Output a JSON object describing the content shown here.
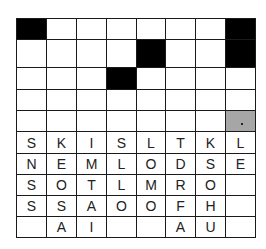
{
  "puzzle": {
    "type": "crossword-letter-drop",
    "columns": 8,
    "col_edges": [
      16,
      46,
      76,
      106,
      136,
      165,
      195,
      225,
      255
    ],
    "row_edges": [
      18,
      39,
      67,
      89,
      110,
      131,
      153,
      174,
      195,
      216,
      237
    ],
    "colors": {
      "black": "#000000",
      "gray": "#a6a6a6",
      "line": "#1a1a1a",
      "text": "#222222"
    },
    "answer_grid": [
      [
        "#",
        "",
        "",
        "",
        "",
        "",
        "",
        "#"
      ],
      [
        "",
        "",
        "",
        "",
        "#",
        "",
        "",
        "#"
      ],
      [
        "",
        "",
        "",
        "#",
        "",
        "",
        "",
        ""
      ],
      [
        "",
        "",
        "",
        "",
        "",
        "",
        "",
        ""
      ],
      [
        "",
        "",
        "",
        "",
        "",
        "",
        "",
        "gray"
      ]
    ],
    "letter_bank": [
      [
        "S",
        "K",
        "I",
        "S",
        "L",
        "T",
        "K",
        "L"
      ],
      [
        "N",
        "E",
        "M",
        "L",
        "O",
        "D",
        "S",
        "E"
      ],
      [
        "S",
        "O",
        "T",
        "L",
        "M",
        "R",
        "O",
        ""
      ],
      [
        "S",
        "S",
        "A",
        "O",
        "O",
        "F",
        "H",
        ""
      ],
      [
        "",
        "A",
        "I",
        "",
        "",
        "A",
        "U",
        ""
      ]
    ]
  }
}
